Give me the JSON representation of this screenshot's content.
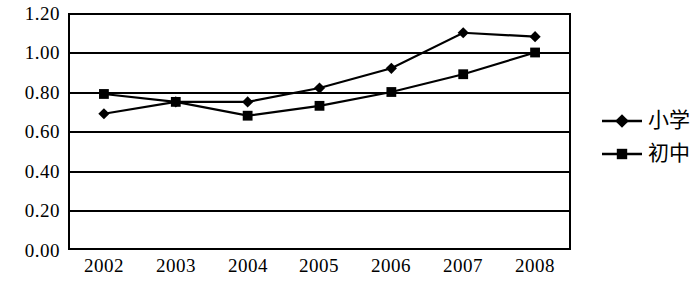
{
  "chart_data": {
    "type": "line",
    "title": "",
    "subtitle": "",
    "xlabel": "",
    "ylabel": "",
    "categories": [
      "2002",
      "2003",
      "2004",
      "2005",
      "2006",
      "2007",
      "2008"
    ],
    "series": [
      {
        "name": "小学",
        "marker": "diamond",
        "color": "#000000",
        "values": [
          0.69,
          0.75,
          0.75,
          0.82,
          0.92,
          1.1,
          1.08
        ]
      },
      {
        "name": "初中",
        "marker": "square",
        "color": "#000000",
        "values": [
          0.79,
          0.75,
          0.68,
          0.73,
          0.8,
          0.89,
          1.0
        ]
      }
    ],
    "ylim": [
      0.0,
      1.2
    ],
    "ytick_step": 0.2,
    "ytick_labels": [
      "1.20",
      "1.00",
      "0.80",
      "0.60",
      "0.40",
      "0.20",
      "0.00"
    ],
    "ytick_values": [
      1.2,
      1.0,
      0.8,
      0.6,
      0.4,
      0.2,
      0.0
    ],
    "grid": "horizontal",
    "legend_position": "right",
    "legend_entries": [
      "小学",
      "初中"
    ],
    "background_color": "#ffffff",
    "line_color": "#000000"
  },
  "axis": {
    "y": {
      "ticks": [
        {
          "label": "1.20"
        },
        {
          "label": "1.00"
        },
        {
          "label": "0.80"
        },
        {
          "label": "0.60"
        },
        {
          "label": "0.40"
        },
        {
          "label": "0.20"
        },
        {
          "label": "0.00"
        }
      ]
    },
    "x": {
      "ticks": [
        {
          "label": "2002"
        },
        {
          "label": "2003"
        },
        {
          "label": "2004"
        },
        {
          "label": "2005"
        },
        {
          "label": "2006"
        },
        {
          "label": "2007"
        },
        {
          "label": "2008"
        }
      ]
    }
  },
  "legend": {
    "items": [
      {
        "label": "小学",
        "marker": "diamond"
      },
      {
        "label": "初中",
        "marker": "square"
      }
    ]
  }
}
